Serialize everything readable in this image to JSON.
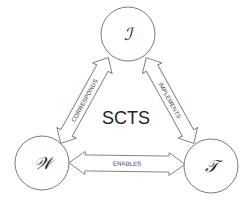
{
  "diagram": {
    "title": "SCTS",
    "nodes": [
      {
        "id": "I",
        "label": "ℐ",
        "cx": 128,
        "cy": 34,
        "r": 27
      },
      {
        "id": "W",
        "label": "𝒲",
        "cx": 42,
        "cy": 163,
        "r": 27
      },
      {
        "id": "T",
        "label": "𝒯",
        "cx": 211,
        "cy": 166,
        "r": 27
      }
    ],
    "edges": [
      {
        "from": "W",
        "to": "I",
        "label": "CORRESPONDS",
        "direction": "bidirectional"
      },
      {
        "from": "I",
        "to": "T",
        "label": "IMPLEMENTS",
        "direction": "bidirectional"
      },
      {
        "from": "W",
        "to": "T",
        "label": "ENABLES",
        "direction": "bidirectional"
      }
    ],
    "colors": {
      "stroke": "#7a7a7a",
      "text": "#222222",
      "background": "#ffffff"
    }
  }
}
